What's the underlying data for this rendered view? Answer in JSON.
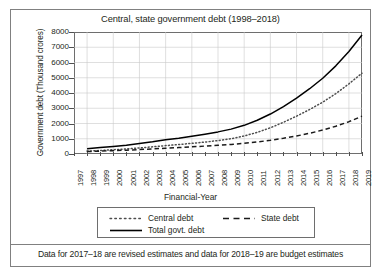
{
  "chart_data": {
    "type": "line",
    "title": "Central, state government debt (1998–2018)",
    "xlabel": "Financial-Year",
    "ylabel": "Government debt (Thousand crores)",
    "xlim": [
      1997,
      2019
    ],
    "ylim": [
      0,
      8000
    ],
    "ytick_step": 1000,
    "grid": true,
    "legend_position": "below-plot",
    "x": [
      1997,
      1998,
      1999,
      2000,
      2001,
      2002,
      2003,
      2004,
      2005,
      2006,
      2007,
      2008,
      2009,
      2010,
      2011,
      2012,
      2013,
      2014,
      2015,
      2016,
      2017,
      2018,
      2019
    ],
    "xticklabels": [
      "1997",
      "1998",
      "1999",
      "2000",
      "2001",
      "2002",
      "2003",
      "2004",
      "2005",
      "2006",
      "2007",
      "2008",
      "2009",
      "2010",
      "2011",
      "2012",
      "2013",
      "2014",
      "2015",
      "2016",
      "2017",
      "2018",
      "2019"
    ],
    "yticklabels": [
      "0",
      "1000",
      "2000",
      "3000",
      "4000",
      "5000",
      "6000",
      "7000",
      "8000"
    ],
    "series": [
      {
        "name": "Central debt",
        "style": "dotted",
        "color": "#4d4d4d",
        "values": [
          null,
          190,
          230,
          280,
          330,
          400,
          470,
          550,
          620,
          700,
          780,
          880,
          1000,
          1180,
          1420,
          1720,
          2080,
          2480,
          2920,
          3400,
          3960,
          4600,
          5300
        ]
      },
      {
        "name": "State debt",
        "style": "dashed",
        "color": "#1a1a1a",
        "values": [
          null,
          160,
          190,
          220,
          250,
          290,
          330,
          380,
          420,
          470,
          520,
          570,
          630,
          700,
          790,
          900,
          1030,
          1180,
          1360,
          1570,
          1820,
          2120,
          2480
        ]
      },
      {
        "name": "Total govt. debt",
        "style": "solid",
        "color": "#000000",
        "values": [
          null,
          350,
          420,
          500,
          580,
          690,
          800,
          930,
          1040,
          1170,
          1300,
          1450,
          1630,
          1880,
          2210,
          2620,
          3110,
          3660,
          4280,
          4970,
          5780,
          6720,
          7800
        ]
      }
    ],
    "footnote": "Data for 2017–18 are revised estimates and data for 2018–19 are budget estimates"
  },
  "legend": {
    "central_label": "Central debt",
    "state_label": "State debt",
    "total_label": "Total govt. debt"
  }
}
